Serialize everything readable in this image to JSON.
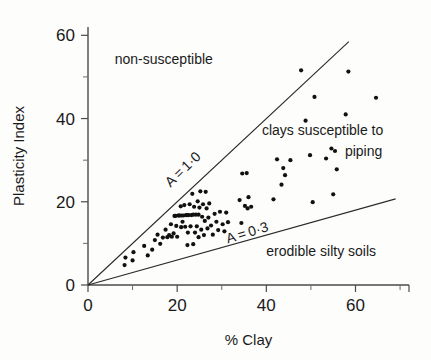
{
  "figure": {
    "background": "#fdfdfc",
    "point_color": "#111111",
    "axis_color": "#4a4a4a",
    "line_color": "#2a2a2a"
  },
  "chart_data": {
    "type": "scatter",
    "title": "",
    "xlabel": "% Clay",
    "ylabel": "Plasticity Index",
    "xlim": [
      0,
      72
    ],
    "ylim": [
      0,
      62
    ],
    "grid": false,
    "legend": "none",
    "x_ticks": [
      0,
      20,
      40,
      60
    ],
    "x_tick_labels": [
      "0",
      "20",
      "40",
      "60"
    ],
    "x_minor_ticks": [
      10,
      30,
      50,
      70
    ],
    "y_ticks": [
      0,
      20,
      40,
      60
    ],
    "y_tick_labels": [
      "0",
      "20",
      "40",
      "60"
    ],
    "y_minor_ticks": [
      10,
      30,
      50
    ],
    "annotations": [
      {
        "text": "non-susceptible",
        "x": 6,
        "y": 53,
        "rotation": 0,
        "anchor": "start",
        "name": "region-label-non-susceptible"
      },
      {
        "text": "clays susceptible to",
        "x": 39,
        "y": 36,
        "rotation": 0,
        "anchor": "start",
        "name": "region-label-clays-line1"
      },
      {
        "text": "piping",
        "x": 66,
        "y": 31,
        "rotation": 0,
        "anchor": "end",
        "name": "region-label-clays-line2"
      },
      {
        "text": "erodible silty soils",
        "x": 40,
        "y": 7,
        "rotation": 0,
        "anchor": "start",
        "name": "region-label-erodible"
      },
      {
        "text": "A = 1·0",
        "x": 22,
        "y": 27,
        "rotation": -44,
        "anchor": "middle",
        "name": "line-label-a-1-0"
      },
      {
        "text": "A = 0·3",
        "x": 36,
        "y": 11.5,
        "rotation": -17,
        "anchor": "middle",
        "name": "line-label-a-0-3"
      }
    ],
    "reference_lines": [
      {
        "name": "A = 1.0",
        "slope": 1.0,
        "intercept": 0,
        "x_from": 0,
        "x_to": 58.5
      },
      {
        "name": "A = 0.3",
        "slope": 0.3,
        "intercept": 0,
        "x_from": 0,
        "x_to": 69
      }
    ],
    "points": [
      [
        8.2,
        4.8
      ],
      [
        8.4,
        6.6
      ],
      [
        10.0,
        5.9
      ],
      [
        10.2,
        7.9
      ],
      [
        12.6,
        9.4
      ],
      [
        13.4,
        7.1
      ],
      [
        14.4,
        8.5
      ],
      [
        15.0,
        10.8
      ],
      [
        15.6,
        12.1
      ],
      [
        16.2,
        9.9
      ],
      [
        16.8,
        11.4
      ],
      [
        17.4,
        13.3
      ],
      [
        17.8,
        11.5
      ],
      [
        18.2,
        12.0
      ],
      [
        18.6,
        14.6
      ],
      [
        18.8,
        11.6
      ],
      [
        19.2,
        12.4
      ],
      [
        19.4,
        16.6
      ],
      [
        19.6,
        16.6
      ],
      [
        19.8,
        14.2
      ],
      [
        20.0,
        11.6
      ],
      [
        20.2,
        16.7
      ],
      [
        20.4,
        16.7
      ],
      [
        20.6,
        16.7
      ],
      [
        20.8,
        18.9
      ],
      [
        20.9,
        13.9
      ],
      [
        21.0,
        16.7
      ],
      [
        21.2,
        15.2
      ],
      [
        21.4,
        16.7
      ],
      [
        21.6,
        19.2
      ],
      [
        21.8,
        14.0
      ],
      [
        22.0,
        16.8
      ],
      [
        22.2,
        16.8
      ],
      [
        22.3,
        9.6
      ],
      [
        22.4,
        12.6
      ],
      [
        22.6,
        16.8
      ],
      [
        22.8,
        19.4
      ],
      [
        23.0,
        14.1
      ],
      [
        23.2,
        16.8
      ],
      [
        23.4,
        21.9
      ],
      [
        23.6,
        16.9
      ],
      [
        23.8,
        18.8
      ],
      [
        24.0,
        12.6
      ],
      [
        24.2,
        16.9
      ],
      [
        24.4,
        14.1
      ],
      [
        24.6,
        20.1
      ],
      [
        24.8,
        16.9
      ],
      [
        25.0,
        18.6
      ],
      [
        25.2,
        22.5
      ],
      [
        25.4,
        13.3
      ],
      [
        25.6,
        16.4
      ],
      [
        25.8,
        19.4
      ],
      [
        26.0,
        12.0
      ],
      [
        26.2,
        15.4
      ],
      [
        26.4,
        22.4
      ],
      [
        26.6,
        18.4
      ],
      [
        26.8,
        13.6
      ],
      [
        27.0,
        16.2
      ],
      [
        27.2,
        19.6
      ],
      [
        27.6,
        14.3
      ],
      [
        28.0,
        12.1
      ],
      [
        28.4,
        17.1
      ],
      [
        28.8,
        15.2
      ],
      [
        29.2,
        13.2
      ],
      [
        29.6,
        17.6
      ],
      [
        30.2,
        14.6
      ],
      [
        30.6,
        12.9
      ],
      [
        31.0,
        17.4
      ],
      [
        31.4,
        15.1
      ],
      [
        23.6,
        9.8
      ],
      [
        24.8,
        11.5
      ],
      [
        34.0,
        20.4
      ],
      [
        34.4,
        14.9
      ],
      [
        34.6,
        26.8
      ],
      [
        35.2,
        19.0
      ],
      [
        35.6,
        26.9
      ],
      [
        35.8,
        18.4
      ],
      [
        36.0,
        21.1
      ],
      [
        36.6,
        18.8
      ],
      [
        41.6,
        20.6
      ],
      [
        42.4,
        30.2
      ],
      [
        43.4,
        24.1
      ],
      [
        43.8,
        28.1
      ],
      [
        44.2,
        26.4
      ],
      [
        45.4,
        30.0
      ],
      [
        47.8,
        51.6
      ],
      [
        48.8,
        39.5
      ],
      [
        49.8,
        31.2
      ],
      [
        50.4,
        19.9
      ],
      [
        50.8,
        45.2
      ],
      [
        53.4,
        30.4
      ],
      [
        54.6,
        32.8
      ],
      [
        55.0,
        21.8
      ],
      [
        55.4,
        32.2
      ],
      [
        55.8,
        27.8
      ],
      [
        57.8,
        41.0
      ],
      [
        58.4,
        51.3
      ],
      [
        64.6,
        45.0
      ]
    ]
  }
}
